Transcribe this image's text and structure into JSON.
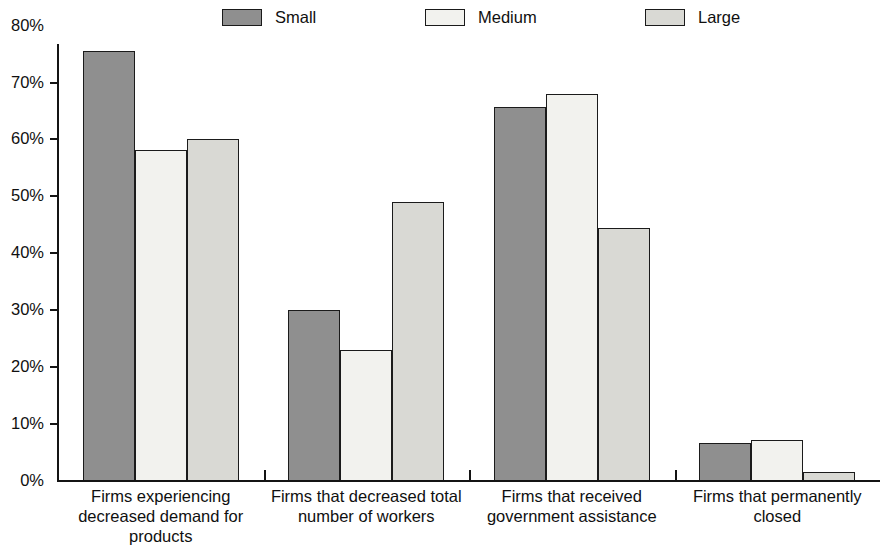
{
  "chart_data": {
    "type": "bar",
    "title": "",
    "subtitle": "",
    "xlabel": "",
    "ylabel": "",
    "ylim": [
      0,
      80
    ],
    "ytick_labels": [
      "80%",
      "70%",
      "60%",
      "50%",
      "40%",
      "30%",
      "20%",
      "10%",
      "0%"
    ],
    "ytick_values": [
      80,
      70,
      60,
      50,
      40,
      30,
      20,
      10,
      0
    ],
    "grid": false,
    "legend_position": "top",
    "categories": [
      "Firms experiencing decreased demand for products",
      "Firms that decreased total number of workers",
      "Firms that received government assistance",
      "Firms that permanently closed"
    ],
    "category_lines": [
      [
        "Firms experiencing",
        "decreased demand for",
        "products"
      ],
      [
        "Firms that decreased total",
        "number of workers"
      ],
      [
        "Firms that received",
        "government assistance"
      ],
      [
        "Firms that permanently",
        "closed"
      ]
    ],
    "series": [
      {
        "name": "Small",
        "color": "#8f8f8f",
        "values": [
          75.6,
          30.1,
          65.8,
          6.7
        ]
      },
      {
        "name": "Medium",
        "color": "#f2f2ee",
        "values": [
          58.3,
          23.1,
          68.0,
          7.3
        ]
      },
      {
        "name": "Large",
        "color": "#d9d9d4",
        "values": [
          60.1,
          49.1,
          44.5,
          1.5
        ]
      }
    ]
  },
  "legend": {
    "items": [
      {
        "label": "Small",
        "color": "#8f8f8f"
      },
      {
        "label": "Medium",
        "color": "#f2f2ee"
      },
      {
        "label": "Large",
        "color": "#d9d9d4"
      }
    ]
  },
  "axis": {
    "border_color": "#141414"
  }
}
